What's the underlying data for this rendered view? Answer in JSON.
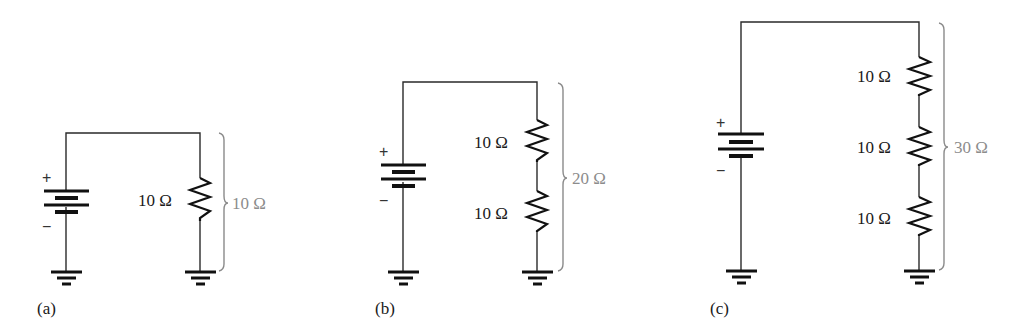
{
  "figure": {
    "colors": {
      "wire": "#2a2a2a",
      "component": "#111111",
      "total_label": "#8c8c8c",
      "label": "#1a1a1a"
    },
    "circuits": [
      {
        "caption": "(a)",
        "battery": {
          "plus": "+",
          "minus": "−"
        },
        "resistors": [
          {
            "label": "10 Ω"
          }
        ],
        "total_label": "10 Ω"
      },
      {
        "caption": "(b)",
        "battery": {
          "plus": "+",
          "minus": "−"
        },
        "resistors": [
          {
            "label": "10 Ω"
          },
          {
            "label": "10 Ω"
          }
        ],
        "total_label": "20 Ω"
      },
      {
        "caption": "(c)",
        "battery": {
          "plus": "+",
          "minus": "−"
        },
        "resistors": [
          {
            "label": "10 Ω"
          },
          {
            "label": "10 Ω"
          },
          {
            "label": "10 Ω"
          }
        ],
        "total_label": "30 Ω"
      }
    ]
  }
}
